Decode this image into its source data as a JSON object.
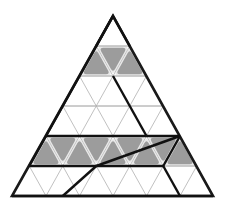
{
  "figure": {
    "name": "triangular-grid-net-diagram",
    "type": "geometric-diagram",
    "background_color": "#ffffff",
    "canvas": {
      "width": 226,
      "height": 208
    }
  },
  "geometry": {
    "outer_triangle": {
      "apex": [
        113,
        16
      ],
      "bottom_left": [
        12,
        196
      ],
      "bottom_right": [
        213,
        196
      ],
      "rows": 6,
      "row_height": 30,
      "cell_half_width": 16.75
    },
    "colors": {
      "outline": "#1a1a1a",
      "grid_line": "#b0b0b0",
      "bold_line": "#111111",
      "shade_fill": "#9c9c9c",
      "shade_halo": "#e8e8e8"
    },
    "stroke_widths": {
      "outline": 2.6,
      "grid": 0.8,
      "bold": 2.4
    }
  },
  "shaded_cells": {
    "label": "shaded rounded triangles",
    "fill": "#9c9c9c",
    "row_2": [
      {
        "orientation": "up",
        "index": 0
      },
      {
        "orientation": "down",
        "index": 0
      },
      {
        "orientation": "up",
        "index": 1
      }
    ],
    "row_5": [
      {
        "orientation": "up",
        "index": 0
      },
      {
        "orientation": "down",
        "index": 0
      },
      {
        "orientation": "up",
        "index": 1
      },
      {
        "orientation": "down",
        "index": 1
      },
      {
        "orientation": "up",
        "index": 2
      },
      {
        "orientation": "down",
        "index": 2
      },
      {
        "orientation": "up",
        "index": 3
      },
      {
        "orientation": "down",
        "index": 3
      },
      {
        "orientation": "up",
        "index": 4
      }
    ]
  },
  "bold_overlay": {
    "label": "bold fold lines",
    "paths": [
      "M 96.25 46 L 113 16 L 129.75 46",
      "M 62.75 106 L 113 16",
      "M 113 76 L 146.5 136",
      "M 62.75 106 L 29.25 166",
      "M 29.25 166 L 96.25 166",
      "M 46 136 L 180 136",
      "M 96.25 166 L 163.25 166",
      "M 96.25 166 L 62.75 196",
      "M 96.25 166 L 180 136",
      "M 180 136 L 163.25 166",
      "M 163.25 166 L 180 196",
      "M 12 196 L 213 196"
    ]
  },
  "accessibility": {
    "description": "A large equilateral triangle subdivided into a six-row triangular grid. Two horizontal bands of cells are filled with grey rounded triangles, and several bold line segments trace a folding net across the grid."
  }
}
